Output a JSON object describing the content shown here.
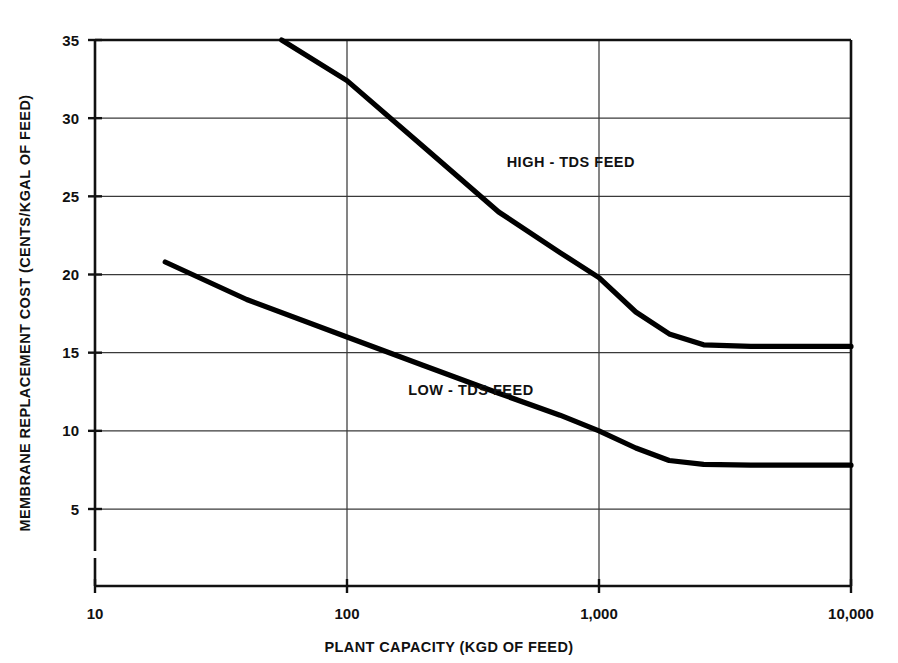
{
  "chart_data": {
    "type": "line",
    "title": "",
    "xlabel": "PLANT CAPACITY (KGD OF FEED)",
    "ylabel": "MEMBRANE REPLACEMENT COST (CENTS/KGAL OF FEED)",
    "xscale": "log",
    "yscale": "linear",
    "xlim": [
      10,
      10000
    ],
    "ylim": [
      0,
      35
    ],
    "grid": true,
    "legend": "inline-annotations",
    "x_ticks": [
      {
        "value": 10,
        "label": "10"
      },
      {
        "value": 100,
        "label": "100"
      },
      {
        "value": 1000,
        "label": "1,000"
      },
      {
        "value": 10000,
        "label": "10,000"
      }
    ],
    "y_ticks": [
      {
        "value": 5,
        "label": "5"
      },
      {
        "value": 10,
        "label": "10"
      },
      {
        "value": 15,
        "label": "15"
      },
      {
        "value": 20,
        "label": "20"
      },
      {
        "value": 25,
        "label": "25"
      },
      {
        "value": 30,
        "label": "30"
      },
      {
        "value": 35,
        "label": "35"
      }
    ],
    "y_axis_break": true,
    "series": [
      {
        "name": "HIGH - TDS FEED",
        "label": "HIGH - TDS FEED",
        "color": "#000000",
        "points": [
          {
            "x": 55,
            "y": 35.0
          },
          {
            "x": 100,
            "y": 32.4
          },
          {
            "x": 200,
            "y": 28.2
          },
          {
            "x": 400,
            "y": 24.0
          },
          {
            "x": 700,
            "y": 21.4
          },
          {
            "x": 1000,
            "y": 19.8
          },
          {
            "x": 1400,
            "y": 17.6
          },
          {
            "x": 1900,
            "y": 16.2
          },
          {
            "x": 2600,
            "y": 15.5
          },
          {
            "x": 4000,
            "y": 15.4
          },
          {
            "x": 10000,
            "y": 15.4
          }
        ]
      },
      {
        "name": "LOW - TDS FEED",
        "label": "LOW - TDS FEED",
        "color": "#000000",
        "points": [
          {
            "x": 19,
            "y": 20.8
          },
          {
            "x": 40,
            "y": 18.4
          },
          {
            "x": 100,
            "y": 16.0
          },
          {
            "x": 200,
            "y": 14.2
          },
          {
            "x": 400,
            "y": 12.4
          },
          {
            "x": 700,
            "y": 11.0
          },
          {
            "x": 1000,
            "y": 10.0
          },
          {
            "x": 1400,
            "y": 8.9
          },
          {
            "x": 1900,
            "y": 8.1
          },
          {
            "x": 2600,
            "y": 7.85
          },
          {
            "x": 4000,
            "y": 7.8
          },
          {
            "x": 10000,
            "y": 7.8
          }
        ]
      }
    ],
    "annotations": [
      {
        "text": "HIGH - TDS FEED",
        "x": 430,
        "y": 27.2
      },
      {
        "text": "LOW - TDS FEED",
        "x": 175,
        "y": 12.6
      }
    ]
  }
}
